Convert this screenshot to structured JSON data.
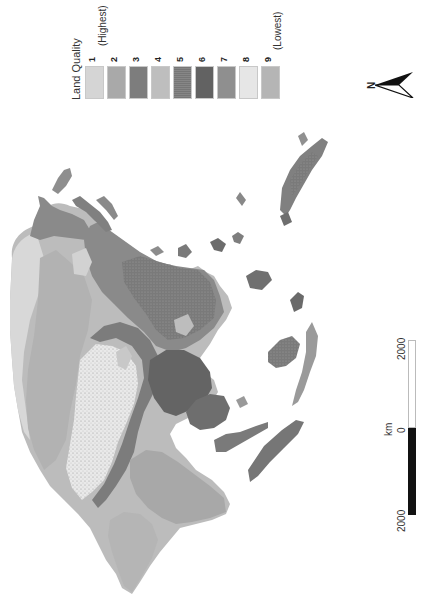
{
  "legend": {
    "title": "Land Quality",
    "classes": [
      {
        "value": "1",
        "note": "(Highest)",
        "color": "#d5d5d5"
      },
      {
        "value": "2",
        "note": "",
        "color": "#a9a9a9"
      },
      {
        "value": "3",
        "note": "",
        "color": "#7d7d7d"
      },
      {
        "value": "4",
        "note": "",
        "color": "#bebebe"
      },
      {
        "value": "5",
        "note": "",
        "color": "#868686"
      },
      {
        "value": "6",
        "note": "",
        "color": "#626262"
      },
      {
        "value": "7",
        "note": "",
        "color": "#8f8f8f"
      },
      {
        "value": "8",
        "note": "",
        "color": "#e6e6e6"
      },
      {
        "value": "9",
        "note": "(Lowest)",
        "color": "#b5b5b5"
      }
    ]
  },
  "north_arrow": {
    "label": "N",
    "icon": "north-arrow-icon"
  },
  "scale_bar": {
    "unit": "km",
    "ticks": [
      "2000",
      "0",
      "2000"
    ],
    "colors": {
      "filled": "#111111",
      "empty": "#ffffff"
    }
  },
  "map": {
    "subject": "Land quality classes across Asia (rotated orientation)",
    "background": "#ffffff"
  }
}
